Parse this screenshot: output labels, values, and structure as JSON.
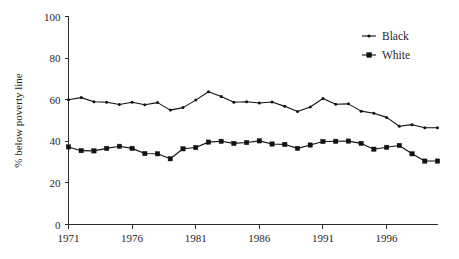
{
  "chart_data": {
    "type": "line",
    "title": "",
    "xlabel": "",
    "ylabel": "% below poverty line",
    "xlim": [
      1971,
      2000
    ],
    "ylim": [
      0,
      100
    ],
    "grid": false,
    "legend_position": "top-right",
    "x_ticks": [
      "1971",
      "1976",
      "1981",
      "1986",
      "1991",
      "1996"
    ],
    "x_tick_values": [
      1971,
      1976,
      1981,
      1986,
      1991,
      1996
    ],
    "y_ticks": [
      "0",
      "20",
      "40",
      "60",
      "80",
      "100"
    ],
    "y_tick_values": [
      0,
      20,
      40,
      60,
      80,
      100
    ],
    "x": [
      1971,
      1972,
      1973,
      1974,
      1975,
      1976,
      1977,
      1978,
      1979,
      1980,
      1981,
      1982,
      1983,
      1984,
      1985,
      1986,
      1987,
      1988,
      1989,
      1990,
      1991,
      1992,
      1993,
      1994,
      1995,
      1996,
      1997,
      1998,
      1999,
      2000
    ],
    "series": [
      {
        "name": "Black",
        "marker": "dot",
        "color": "#111111",
        "values": [
          60.0,
          61.0,
          59.0,
          58.8,
          57.7,
          58.8,
          57.6,
          58.6,
          55.0,
          56.2,
          59.8,
          63.8,
          61.5,
          58.8,
          59.0,
          58.4,
          58.9,
          56.8,
          54.3,
          56.5,
          60.6,
          57.8,
          58.0,
          54.5,
          53.5,
          51.5,
          47.2,
          48.0,
          46.5,
          46.5
        ]
      },
      {
        "name": "White",
        "marker": "square",
        "color": "#111111",
        "values": [
          37.3,
          35.5,
          35.4,
          36.6,
          37.6,
          36.6,
          34.1,
          34.0,
          31.6,
          36.4,
          37.0,
          39.6,
          40.0,
          39.0,
          39.4,
          40.2,
          38.7,
          38.5,
          36.6,
          38.2,
          39.9,
          40.0,
          40.1,
          39.0,
          36.2,
          37.1,
          38.0,
          34.0,
          30.5,
          30.5
        ]
      }
    ]
  },
  "legend": {
    "items": [
      {
        "label": "Black"
      },
      {
        "label": "White"
      }
    ]
  }
}
